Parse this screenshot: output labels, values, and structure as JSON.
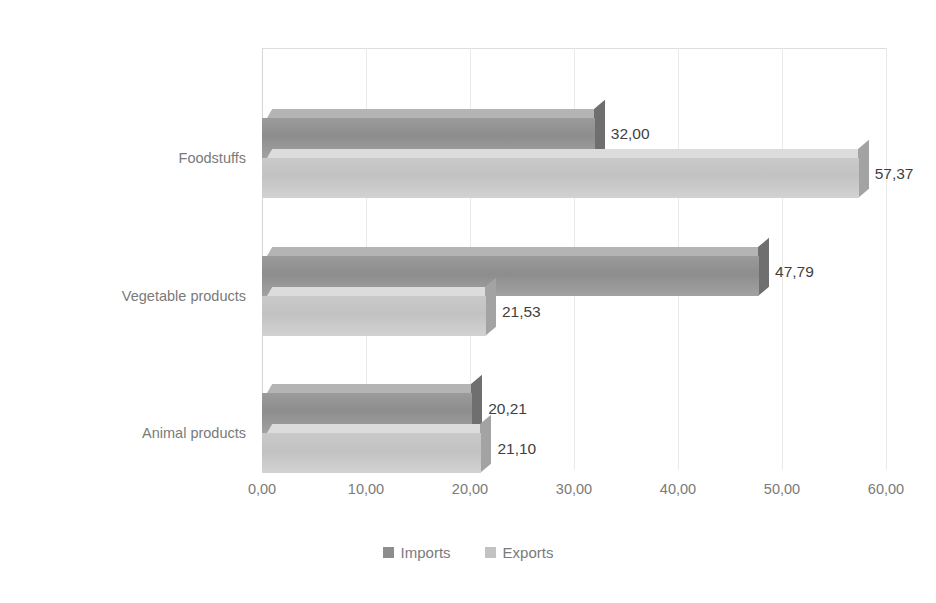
{
  "chart_data": {
    "type": "bar",
    "orientation": "horizontal",
    "style": "3d-clustered-bar",
    "title": "",
    "xlabel": "",
    "ylabel": "",
    "xlim": [
      0,
      60
    ],
    "xtick_step": 10,
    "grid": true,
    "legend_position": "bottom",
    "categories": [
      "Animal products",
      "Vegetable products",
      "Foodstuffs"
    ],
    "series": [
      {
        "name": "Imports",
        "color": "#8d8d8d",
        "values": [
          20.21,
          47.79,
          32.0
        ],
        "labels": [
          "20,21",
          "47,79",
          "32,00"
        ]
      },
      {
        "name": "Exports",
        "color": "#c2c2c2",
        "values": [
          21.1,
          21.53,
          57.37
        ],
        "labels": [
          "21,10",
          "21,53",
          "57,37"
        ]
      }
    ],
    "xtick_labels": [
      "0,00",
      "10,00",
      "20,00",
      "30,00",
      "40,00",
      "50,00",
      "60,00"
    ],
    "xtick_values": [
      0,
      10,
      20,
      30,
      40,
      50,
      60
    ]
  },
  "axis": {
    "category_labels": [
      "Foodstuffs",
      "Vegetable products",
      "Animal products"
    ]
  },
  "legend": {
    "items": [
      {
        "label": "Imports",
        "color": "#8d8d8d"
      },
      {
        "label": "Exports",
        "color": "#c2c2c2"
      }
    ]
  }
}
